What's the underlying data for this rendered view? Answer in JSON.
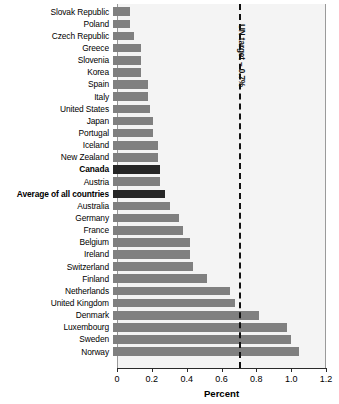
{
  "chart_data": {
    "type": "bar",
    "orientation": "horizontal",
    "title": "",
    "xlabel": "Percent",
    "ylabel": "",
    "xlim": [
      0,
      1.2
    ],
    "xticks": [
      "0",
      "0.2",
      "0.4",
      "0.6",
      "0.8",
      "1.0",
      "1.2"
    ],
    "xtick_values": [
      0,
      0.2,
      0.4,
      0.6,
      0.8,
      1.0,
      1.2
    ],
    "grid": false,
    "legend": "none",
    "bar_color": "#808080",
    "highlight_color": "#262626",
    "plot_background": "#f4f4f4",
    "annotations": [
      {
        "name": "un-target-line",
        "label": "UN target – 0.7%",
        "value": 0.7,
        "style": "dashed vertical line"
      }
    ],
    "categories": [
      "Slovak Republic",
      "Poland",
      "Czech Republic",
      "Greece",
      "Slovenia",
      "Korea",
      "Spain",
      "Italy",
      "United States",
      "Japan",
      "Portugal",
      "Iceland",
      "New Zealand",
      "Canada",
      "Austria",
      "Average of all countries",
      "Australia",
      "Germany",
      "France",
      "Belgium",
      "Ireland",
      "Switzerland",
      "Finland",
      "Netherlands",
      "United Kingdom",
      "Denmark",
      "Luxembourg",
      "Sweden",
      "Norway"
    ],
    "values": [
      0.1,
      0.1,
      0.12,
      0.16,
      0.16,
      0.16,
      0.2,
      0.2,
      0.21,
      0.23,
      0.23,
      0.26,
      0.26,
      0.27,
      0.27,
      0.3,
      0.33,
      0.38,
      0.4,
      0.44,
      0.44,
      0.46,
      0.54,
      0.67,
      0.7,
      0.84,
      1.0,
      1.02,
      1.07
    ],
    "highlighted": [
      "Canada",
      "Average of all countries"
    ],
    "bold_labels": [
      "Canada",
      "Average of all countries"
    ]
  }
}
